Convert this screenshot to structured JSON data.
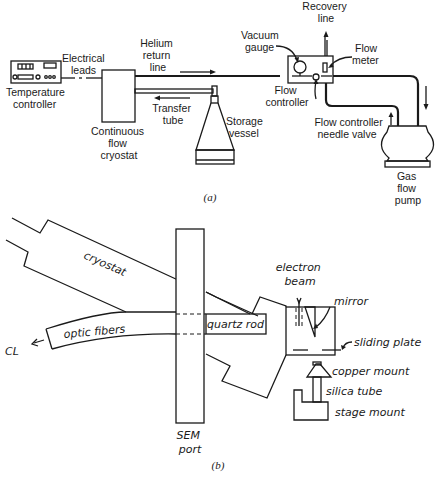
{
  "figure_a": {
    "caption": "(a)",
    "labels": {
      "temperature_controller": [
        "Temperature",
        "controller"
      ],
      "electrical_leads": [
        "Electrical",
        "leads"
      ],
      "helium_return_line": [
        "Helium",
        "return",
        "line"
      ],
      "continuous_flow_cryostat": [
        "Continuous",
        "flow",
        "cryostat"
      ],
      "transfer_tube": [
        "Transfer",
        "tube"
      ],
      "storage_vessel": [
        "Storage",
        "vessel"
      ],
      "vacuum_gauge": [
        "Vacuum",
        "gauge"
      ],
      "recovery_line": [
        "Recovery",
        "line"
      ],
      "flow_meter": [
        "Flow",
        "meter"
      ],
      "flow_controller": [
        "Flow",
        "controller"
      ],
      "needle_valve": [
        "Flow controller",
        "needle valve"
      ],
      "gas_flow_pump": [
        "Gas",
        "flow",
        "pump"
      ]
    }
  },
  "figure_b": {
    "caption": "(b)",
    "labels": {
      "cryostat": "cryostat",
      "optic_fibers": "optic  fibers",
      "cl": "CL",
      "quartz_rod": "quartz  rod",
      "sem_port": [
        "SEM",
        "port"
      ],
      "electron_beam": [
        "electron",
        "beam"
      ],
      "mirror": "mirror",
      "sliding_plate": "sliding plate",
      "copper_mount": "copper mount",
      "silica_tube": "silica  tube",
      "stage_mount": "stage mount"
    }
  },
  "colors": {
    "ink": "#1a1a1a",
    "background": "#ffffff"
  }
}
